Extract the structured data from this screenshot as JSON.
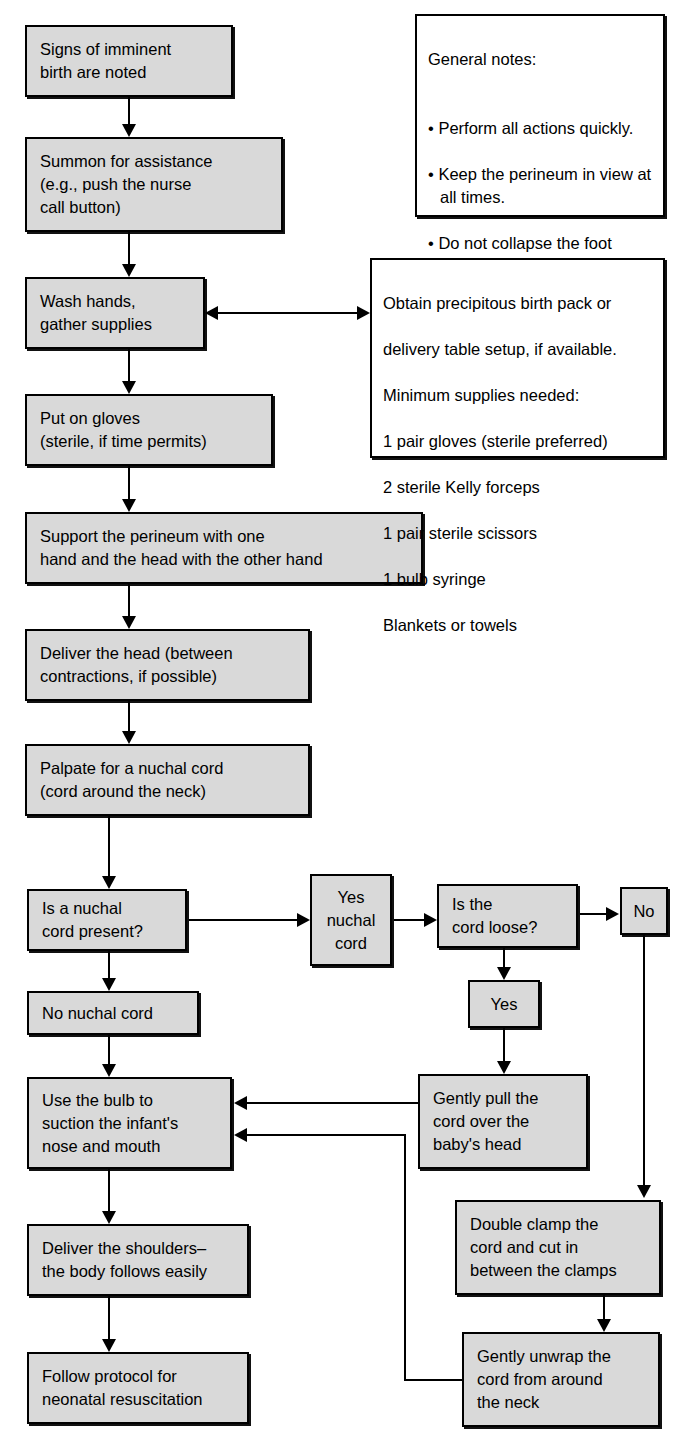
{
  "diagram": {
    "box_fill": "#d9d9d9",
    "note_fill": "#ffffff",
    "line_color": "#000000"
  },
  "nodes": {
    "signs": "Signs of imminent\nbirth are noted",
    "summon": "Summon for assistance\n(e.g., push the nurse\ncall button)",
    "wash": "Wash hands,\ngather supplies",
    "gloves": "Put on gloves\n(sterile, if time permits)",
    "support": "Support the perineum with one\nhand and the head with the other hand",
    "deliver_head": "Deliver the head (between\ncontractions, if possible)",
    "palpate": "Palpate for a nuchal cord\n(cord around the neck)",
    "is_nuchal": "Is a nuchal\ncord present?",
    "yes_nuchal": "Yes\nnuchal\ncord",
    "is_loose": "Is the\ncord loose?",
    "no_loose": "No",
    "yes_loose": "Yes",
    "no_nuchal": "No nuchal cord",
    "bulb": "Use the bulb to\nsuction the infant's\nnose and mouth",
    "gently_pull": "Gently pull the\ncord over the\nbaby's head",
    "double_clamp": "Double clamp the\ncord and cut in\nbetween the clamps",
    "unwrap": "Gently unwrap the\ncord from around\nthe neck",
    "shoulders": "Deliver the shoulders–\nthe body follows easily",
    "follow_protocol": "Follow protocol for\nneonatal resuscitation"
  },
  "general_notes": {
    "heading": "General notes:",
    "items": [
      "Perform all actions quickly.",
      "Keep the perineum in view at all times.",
      "Do not collapse the foot section of the bed.",
      "Try to deliver the baby between contractions."
    ]
  },
  "supplies_note": {
    "lines": [
      "Obtain precipitous birth pack or",
      "delivery table setup, if available.",
      "Minimum supplies needed:",
      "1 pair gloves (sterile preferred)",
      "2 sterile Kelly forceps",
      "1 pair sterile scissors",
      "1 bulb syringe",
      "Blankets or towels"
    ]
  }
}
